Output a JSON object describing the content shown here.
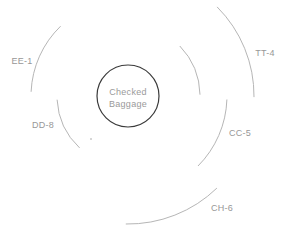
{
  "diagram": {
    "background_color": "#ffffff",
    "arc_color": "#b6b6b6",
    "label_color": "#979797",
    "center_node": {
      "label_line1": "Checked",
      "label_line2": "Baggage",
      "cx": 128,
      "cy": 96,
      "r": 31,
      "stroke_color": "#3a3a3a",
      "label_color": "#9a9a9a"
    },
    "belts": [
      {
        "id": "ee-1",
        "label": "EE-1",
        "radius": 97,
        "start_deg": 134,
        "end_deg": 177.5,
        "label_x": 22,
        "label_y": 64
      },
      {
        "id": "dd-8",
        "label": "DD-8",
        "radius": 71,
        "start_deg": 183,
        "end_deg": 227,
        "label_x": 43,
        "label_y": 128
      },
      {
        "id": "tt-4",
        "label": "TT-4",
        "radius": 126,
        "start_deg": 45,
        "end_deg": -0.5,
        "label_x": 265,
        "label_y": 56
      },
      {
        "id": "inner-upper-right",
        "label": "",
        "radius": 72,
        "start_deg": 44,
        "end_deg": 1
      },
      {
        "id": "cc-5",
        "label": "CC-5",
        "radius": 99,
        "start_deg": -2,
        "end_deg": -45,
        "label_x": 240,
        "label_y": 136
      },
      {
        "id": "ch-6",
        "label": "CH-6",
        "radius": 128,
        "start_deg": -46,
        "end_deg": -91,
        "label_x": 222,
        "label_y": 211
      }
    ],
    "dot": {
      "x": 91,
      "y": 139,
      "r": 1,
      "color": "#c9c9c9"
    }
  }
}
